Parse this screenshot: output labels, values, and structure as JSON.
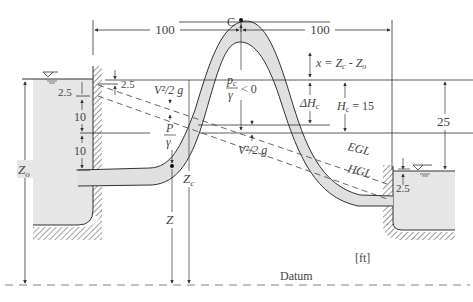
{
  "diagram": {
    "units": "[ft]",
    "datum_label": "Datum",
    "summit_label": "C",
    "dimensions": {
      "horizontal_left": "100",
      "horizontal_right": "100",
      "left_top_gap": "2.5",
      "left_drop_1": "10",
      "left_drop_2": "10",
      "left_upper_gap": "2.5",
      "right_submergence": "2.5",
      "level_difference": "25",
      "hc_value": "H",
      "hc_sub": "c",
      "hc_eq": " = 15",
      "x_expr_prefix": "x = Z",
      "x_expr_sub1": "c",
      "x_expr_mid": " - Z",
      "x_expr_sub2": "o",
      "delta_h": "ΔH",
      "delta_h_sub": "c"
    },
    "labels": {
      "velocity_head_left": "V²/2 g",
      "velocity_head_right": "V²/2 g",
      "pressure_head_P": "P",
      "pressure_head_gamma": "γ",
      "summit_pressure_num": "p",
      "summit_pressure_num_sub": "c",
      "summit_pressure_den": "γ",
      "summit_pressure_cond": "< 0",
      "z_label": "Z",
      "zc_label": "Z",
      "zc_sub": "c",
      "zo_label": "Z",
      "zo_sub": "o",
      "egl": "EGL",
      "hgl": "HGL"
    },
    "colors": {
      "water": "#e6e6e6",
      "pipe": "#e0e0e0",
      "line": "#333333",
      "dim": "#555555",
      "dash": "#777777"
    }
  }
}
